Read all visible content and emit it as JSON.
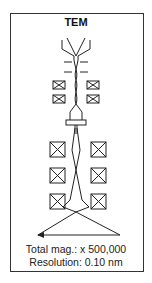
{
  "diagram": {
    "title": "TEM",
    "components": [
      {
        "name": "electron-source",
        "icon": "electron-gun-icon"
      },
      {
        "name": "condenser-apertures",
        "count": 2
      },
      {
        "name": "condenser-lenses",
        "count": 4
      },
      {
        "name": "specimen-holder"
      },
      {
        "name": "objective-projector-lenses",
        "count": 6
      },
      {
        "name": "image-plane-arrow"
      }
    ],
    "specs": {
      "magnification": "Total mag.: x 500,000",
      "resolution": "Resolution: 0.10 nm"
    },
    "colors": {
      "stroke": "#222222",
      "background": "#ffffff",
      "frame": "#333333"
    }
  }
}
